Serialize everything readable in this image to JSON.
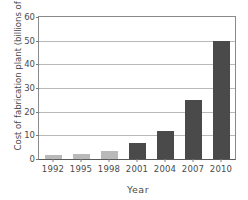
{
  "chart_data": {
    "type": "bar",
    "title": "",
    "subtitle": "",
    "xlabel": "Year",
    "ylabel": "Cost of fabrication plant (billions of dollars)",
    "categories": [
      "1992",
      "1995",
      "1998",
      "2001",
      "2004",
      "2007",
      "2010"
    ],
    "values": [
      1.5,
      2.3,
      3.4,
      6.7,
      12,
      25,
      50
    ],
    "series": [
      {
        "name": "Cost of fabrication plant",
        "values": [
          1.5,
          2.3,
          3.4,
          6.7,
          12,
          25,
          50
        ]
      }
    ],
    "bar_colors": [
      "#b9b9b9",
      "#b9b9b9",
      "#b9b9b9",
      "#4a4a4a",
      "#4a4a4a",
      "#4a4a4a",
      "#4a4a4a"
    ],
    "ylim": [
      0,
      60
    ],
    "yticks": [
      0,
      10,
      20,
      30,
      40,
      50,
      60
    ],
    "ytick_labels": [
      "0",
      "10",
      "20",
      "30",
      "40",
      "50",
      "60"
    ],
    "grid": true,
    "grid_axis": "y",
    "legend": false,
    "legend_position": "none",
    "colors": {
      "bar_light": "#b9b9b9",
      "bar_dark": "#4a4a4a",
      "gridline": "#b9b9b9",
      "axis": "#7a7a7a",
      "text": "#4a4a4a",
      "background": "#ffffff"
    }
  }
}
